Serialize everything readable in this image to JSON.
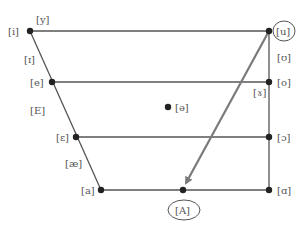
{
  "diagram": {
    "type": "vowel-quadrilateral",
    "points": [
      {
        "id": "i",
        "label": "[i]",
        "x": 30,
        "y": 31,
        "lx": 8,
        "ly": 35
      },
      {
        "id": "e",
        "label": "[e]",
        "x": 52,
        "y": 82,
        "lx": 30,
        "ly": 86
      },
      {
        "id": "epsilon",
        "label": "[ɛ]",
        "x": 76,
        "y": 137,
        "lx": 56,
        "ly": 141
      },
      {
        "id": "a",
        "label": "[a]",
        "x": 101,
        "y": 190,
        "lx": 81,
        "ly": 194
      },
      {
        "id": "u",
        "label": "[u]",
        "x": 269,
        "y": 31,
        "lx": 277,
        "ly": 35,
        "circled": true
      },
      {
        "id": "o",
        "label": "[o]",
        "x": 269,
        "y": 82,
        "lx": 277,
        "ly": 86
      },
      {
        "id": "open-o",
        "label": "[ɔ]",
        "x": 269,
        "y": 137,
        "lx": 277,
        "ly": 141
      },
      {
        "id": "alpha",
        "label": "[ɑ]",
        "x": 269,
        "y": 190,
        "lx": 277,
        "ly": 194
      },
      {
        "id": "schwa",
        "label": "[ə]",
        "x": 168,
        "y": 107,
        "lx": 175,
        "ly": 111
      },
      {
        "id": "A",
        "label": "[A]",
        "x": 183,
        "y": 190,
        "lx": 175,
        "ly": 214,
        "circled": true
      }
    ],
    "free_labels": [
      {
        "id": "y",
        "label": "[y]",
        "x": 36,
        "y": 23
      },
      {
        "id": "small-cap-i",
        "label": "[ɪ]",
        "x": 24,
        "y": 63
      },
      {
        "id": "E",
        "label": "[E]",
        "x": 30,
        "y": 114
      },
      {
        "id": "ae",
        "label": "[æ]",
        "x": 65,
        "y": 167
      },
      {
        "id": "upsilon",
        "label": "[ʊ]",
        "x": 277,
        "y": 61
      },
      {
        "id": "gamma",
        "label": "[ɤ]",
        "x": 253,
        "y": 96
      }
    ],
    "arrow": {
      "from": "u",
      "to": "A",
      "color": "#7a7a7a"
    },
    "colors": {
      "line": "#555555",
      "dot": "#222222",
      "text": "#555555"
    }
  }
}
